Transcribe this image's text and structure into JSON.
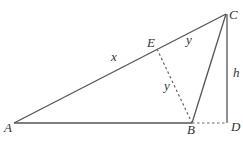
{
  "diagram": {
    "points": {
      "A": {
        "label": "A",
        "x": 14,
        "y": 123
      },
      "B": {
        "label": "B",
        "x": 192,
        "y": 123
      },
      "C": {
        "label": "C",
        "x": 226,
        "y": 14
      },
      "D": {
        "label": "D",
        "x": 227,
        "y": 123
      },
      "E": {
        "label": "E",
        "x": 157,
        "y": 49
      }
    },
    "segment_labels": {
      "AE": "x",
      "EC": "y",
      "EB": "y",
      "CD": "h"
    },
    "colors": {
      "line": "#555555",
      "text": "#333333",
      "background": "#ffffff"
    }
  }
}
